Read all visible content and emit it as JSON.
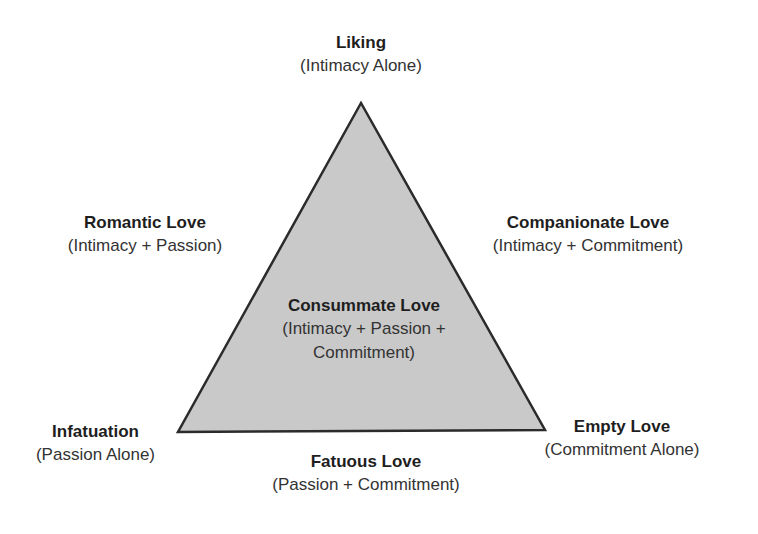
{
  "diagram": {
    "shape": "triangle",
    "fill_color": "#c9c9c9",
    "stroke_color": "#2b2b2b",
    "vertices": {
      "top": [
        361,
        103
      ],
      "bottom_left": [
        178,
        432
      ],
      "bottom_right": [
        545,
        430
      ]
    }
  },
  "labels": {
    "top": {
      "title": "Liking",
      "sub": "(Intimacy Alone)"
    },
    "left_edge": {
      "title": "Romantic Love",
      "sub": "(Intimacy + Passion)"
    },
    "right_edge": {
      "title": "Companionate Love",
      "sub": "(Intimacy + Commitment)"
    },
    "center": {
      "title": "Consummate Love",
      "sub_line1": "(Intimacy + Passion +",
      "sub_line2": "Commitment)"
    },
    "bottom_left": {
      "title": "Infatuation",
      "sub": "(Passion Alone)"
    },
    "bottom_right": {
      "title": "Empty Love",
      "sub": "(Commitment Alone)"
    },
    "bottom_edge": {
      "title": "Fatuous Love",
      "sub": "(Passion + Commitment)"
    }
  }
}
